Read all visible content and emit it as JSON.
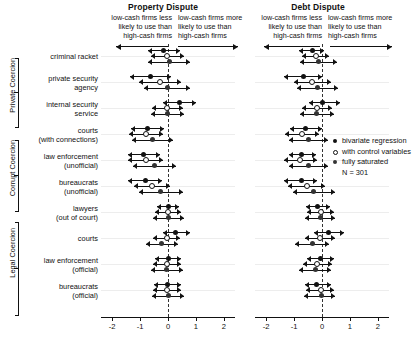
{
  "panels": [
    {
      "title": "Property Dispute",
      "caption_left": "low-cash firms less\nlikely to use than\nhigh-cash firms",
      "caption_right": "low-cash firms more\nlikely to use than\nhigh-cash firms",
      "ticks": [
        "-2",
        "-1",
        "0",
        "1",
        "2"
      ]
    },
    {
      "title": "Debt Dispute",
      "caption_left": "low-cash firms less\nlikely to use than\nhigh-cash firms",
      "caption_right": "low-cash firms more\nlikely to use than\nhigh-cash firms",
      "ticks": [
        "-2",
        "-1",
        "0",
        "1",
        "2"
      ]
    }
  ],
  "groups": [
    {
      "label": "Private Coercion"
    },
    {
      "label": "Corrupt Coercion"
    },
    {
      "label": "Legal Coercion"
    }
  ],
  "categories": [
    "criminal racket",
    "private security\nagency",
    "internal security\nservice",
    "courts\n(with connections)",
    "law enforcement\n(unofficial)",
    "bureaucrats\n(unofficial)",
    "lawyers\n(out of court)",
    "courts",
    "law enforcement\n(official)",
    "bureaucrats\n(official)"
  ],
  "legend": {
    "items": [
      {
        "marker": "filled",
        "label": "bivariate regression"
      },
      {
        "marker": "open",
        "label": "with control variables"
      },
      {
        "marker": "sat",
        "label": "fully saturated"
      }
    ],
    "n_label": "N = 301"
  },
  "chart_data": {
    "type": "scatter",
    "subtype": "coefficient-plot",
    "title": "",
    "xlabel": "",
    "ylabel": "",
    "xlim": [
      -2.4,
      2.4
    ],
    "grid": false,
    "zero_reference_line": 0,
    "legend_position": "middle-right",
    "n": 301,
    "series": [
      {
        "name": "bivariate regression",
        "marker": "filled"
      },
      {
        "name": "with control variables",
        "marker": "open"
      },
      {
        "name": "fully saturated",
        "marker": "sat"
      }
    ],
    "categories": [
      "criminal racket",
      "private security agency",
      "internal security service",
      "courts (with connections)",
      "law enforcement (unofficial)",
      "bureaucrats (unofficial)",
      "lawyers (out of court)",
      "courts",
      "law enforcement (official)",
      "bureaucrats (official)"
    ],
    "groups": [
      {
        "label": "Private Coercion",
        "categories": [
          0,
          1,
          2
        ]
      },
      {
        "label": "Corrupt Coercion",
        "categories": [
          3,
          4,
          5
        ]
      },
      {
        "label": "Legal Coercion",
        "categories": [
          6,
          7,
          8,
          9
        ]
      }
    ],
    "panels": [
      {
        "name": "Property Dispute",
        "estimates": [
          {
            "category": "criminal racket",
            "series": "bivariate regression",
            "estimate": -0.15,
            "ci_low": -0.7,
            "ci_high": 0.42
          },
          {
            "category": "criminal racket",
            "series": "with control variables",
            "estimate": -0.02,
            "ci_low": -0.62,
            "ci_high": 0.58
          },
          {
            "category": "criminal racket",
            "series": "fully saturated",
            "estimate": 0.05,
            "ci_low": -0.7,
            "ci_high": 0.8
          },
          {
            "category": "private security agency",
            "series": "bivariate regression",
            "estimate": -0.62,
            "ci_low": -1.35,
            "ci_high": 0.1
          },
          {
            "category": "private security agency",
            "series": "with control variables",
            "estimate": -0.28,
            "ci_low": -1.05,
            "ci_high": 0.48
          },
          {
            "category": "private security agency",
            "series": "fully saturated",
            "estimate": -0.02,
            "ci_low": -0.85,
            "ci_high": 0.8
          },
          {
            "category": "internal security service",
            "series": "bivariate regression",
            "estimate": 0.4,
            "ci_low": -0.18,
            "ci_high": 1.0
          },
          {
            "category": "internal security service",
            "series": "with control variables",
            "estimate": -0.02,
            "ci_low": -0.58,
            "ci_high": 0.55
          },
          {
            "category": "internal security service",
            "series": "fully saturated",
            "estimate": -0.02,
            "ci_low": -0.62,
            "ci_high": 0.58
          },
          {
            "category": "courts (with connections)",
            "series": "bivariate regression",
            "estimate": -0.72,
            "ci_low": -1.32,
            "ci_high": -0.14
          },
          {
            "category": "courts (with connections)",
            "series": "with control variables",
            "estimate": -0.8,
            "ci_low": -1.4,
            "ci_high": -0.18
          },
          {
            "category": "courts (with connections)",
            "series": "fully saturated",
            "estimate": -0.55,
            "ci_low": -1.28,
            "ci_high": 0.18
          },
          {
            "category": "law enforcement (unofficial)",
            "series": "bivariate regression",
            "estimate": -0.88,
            "ci_low": -1.45,
            "ci_high": -0.28
          },
          {
            "category": "law enforcement (unofficial)",
            "series": "with control variables",
            "estimate": -0.8,
            "ci_low": -1.45,
            "ci_high": -0.18
          },
          {
            "category": "law enforcement (unofficial)",
            "series": "fully saturated",
            "estimate": -0.48,
            "ci_low": -1.25,
            "ci_high": 0.3
          },
          {
            "category": "bureaucrats (unofficial)",
            "series": "bivariate regression",
            "estimate": -0.82,
            "ci_low": -1.42,
            "ci_high": -0.22
          },
          {
            "category": "bureaucrats (unofficial)",
            "series": "with control variables",
            "estimate": -0.58,
            "ci_low": -1.22,
            "ci_high": 0.08
          },
          {
            "category": "bureaucrats (unofficial)",
            "series": "fully saturated",
            "estimate": -0.28,
            "ci_low": -1.05,
            "ci_high": 0.52
          },
          {
            "category": "lawyers (out of court)",
            "series": "bivariate regression",
            "estimate": 0.0,
            "ci_low": -0.4,
            "ci_high": 0.4
          },
          {
            "category": "lawyers (out of court)",
            "series": "with control variables",
            "estimate": 0.0,
            "ci_low": -0.48,
            "ci_high": 0.48
          },
          {
            "category": "lawyers (out of court)",
            "series": "fully saturated",
            "estimate": 0.0,
            "ci_low": -0.55,
            "ci_high": 0.58
          },
          {
            "category": "courts",
            "series": "bivariate regression",
            "estimate": 0.28,
            "ci_low": -0.18,
            "ci_high": 0.78
          },
          {
            "category": "courts",
            "series": "with control variables",
            "estimate": -0.05,
            "ci_low": -0.52,
            "ci_high": 0.42
          },
          {
            "category": "courts",
            "series": "fully saturated",
            "estimate": -0.22,
            "ci_low": -0.78,
            "ci_high": 0.35
          },
          {
            "category": "law enforcement (official)",
            "series": "bivariate regression",
            "estimate": 0.02,
            "ci_low": -0.45,
            "ci_high": 0.48
          },
          {
            "category": "law enforcement (official)",
            "series": "with control variables",
            "estimate": -0.02,
            "ci_low": -0.52,
            "ci_high": 0.48
          },
          {
            "category": "law enforcement (official)",
            "series": "fully saturated",
            "estimate": -0.05,
            "ci_low": -0.62,
            "ci_high": 0.52
          },
          {
            "category": "bureaucrats (official)",
            "series": "bivariate regression",
            "estimate": -0.02,
            "ci_low": -0.5,
            "ci_high": 0.45
          },
          {
            "category": "bureaucrats (official)",
            "series": "with control variables",
            "estimate": -0.05,
            "ci_low": -0.55,
            "ci_high": 0.45
          },
          {
            "category": "bureaucrats (official)",
            "series": "fully saturated",
            "estimate": 0.0,
            "ci_low": -0.58,
            "ci_high": 0.58
          }
        ]
      },
      {
        "name": "Debt Dispute",
        "estimates": [
          {
            "category": "criminal racket",
            "series": "bivariate regression",
            "estimate": -0.35,
            "ci_low": -0.82,
            "ci_high": 0.08
          },
          {
            "category": "criminal racket",
            "series": "with control variables",
            "estimate": -0.22,
            "ci_low": -0.72,
            "ci_high": 0.25
          },
          {
            "category": "criminal racket",
            "series": "fully saturated",
            "estimate": -0.12,
            "ci_low": -0.78,
            "ci_high": 0.52
          },
          {
            "category": "private security agency",
            "series": "bivariate regression",
            "estimate": -0.68,
            "ci_low": -1.35,
            "ci_high": 0.0
          },
          {
            "category": "private security agency",
            "series": "with control variables",
            "estimate": -0.35,
            "ci_low": -1.02,
            "ci_high": 0.32
          },
          {
            "category": "private security agency",
            "series": "fully saturated",
            "estimate": -0.15,
            "ci_low": -0.88,
            "ci_high": 0.58
          },
          {
            "category": "internal security service",
            "series": "bivariate regression",
            "estimate": 0.02,
            "ci_low": -0.48,
            "ci_high": 0.65
          },
          {
            "category": "internal security service",
            "series": "with control variables",
            "estimate": -0.18,
            "ci_low": -0.72,
            "ci_high": 0.35
          },
          {
            "category": "internal security service",
            "series": "fully saturated",
            "estimate": -0.18,
            "ci_low": -0.78,
            "ci_high": 0.42
          },
          {
            "category": "courts (with connections)",
            "series": "bivariate regression",
            "estimate": -0.58,
            "ci_low": -1.15,
            "ci_high": 0.0
          },
          {
            "category": "courts (with connections)",
            "series": "with control variables",
            "estimate": -0.72,
            "ci_low": -1.32,
            "ci_high": -0.12
          },
          {
            "category": "courts (with connections)",
            "series": "fully saturated",
            "estimate": -0.48,
            "ci_low": -1.18,
            "ci_high": 0.22
          },
          {
            "category": "law enforcement (unofficial)",
            "series": "bivariate regression",
            "estimate": -0.72,
            "ci_low": -1.18,
            "ci_high": -0.22
          },
          {
            "category": "law enforcement (unofficial)",
            "series": "with control variables",
            "estimate": -0.78,
            "ci_low": -1.35,
            "ci_high": -0.18
          },
          {
            "category": "law enforcement (unofficial)",
            "series": "fully saturated",
            "estimate": -0.48,
            "ci_low": -1.18,
            "ci_high": 0.22
          },
          {
            "category": "bureaucrats (unofficial)",
            "series": "bivariate regression",
            "estimate": -0.75,
            "ci_low": -1.35,
            "ci_high": -0.18
          },
          {
            "category": "bureaucrats (unofficial)",
            "series": "with control variables",
            "estimate": -0.55,
            "ci_low": -1.22,
            "ci_high": 0.1
          },
          {
            "category": "bureaucrats (unofficial)",
            "series": "fully saturated",
            "estimate": -0.32,
            "ci_low": -1.05,
            "ci_high": 0.45
          },
          {
            "category": "lawyers (out of court)",
            "series": "bivariate regression",
            "estimate": -0.15,
            "ci_low": -0.58,
            "ci_high": 0.28
          },
          {
            "category": "lawyers (out of court)",
            "series": "with control variables",
            "estimate": -0.05,
            "ci_low": -0.55,
            "ci_high": 0.42
          },
          {
            "category": "lawyers (out of court)",
            "series": "fully saturated",
            "estimate": -0.05,
            "ci_low": -0.62,
            "ci_high": 0.48
          },
          {
            "category": "courts",
            "series": "bivariate regression",
            "estimate": 0.25,
            "ci_low": -0.28,
            "ci_high": 0.78
          },
          {
            "category": "courts",
            "series": "with control variables",
            "estimate": -0.08,
            "ci_low": -0.62,
            "ci_high": 0.45
          },
          {
            "category": "courts",
            "series": "fully saturated",
            "estimate": -0.35,
            "ci_low": -0.95,
            "ci_high": 0.25
          },
          {
            "category": "law enforcement (official)",
            "series": "bivariate regression",
            "estimate": -0.05,
            "ci_low": -0.52,
            "ci_high": 0.42
          },
          {
            "category": "law enforcement (official)",
            "series": "with control variables",
            "estimate": -0.18,
            "ci_low": -0.68,
            "ci_high": 0.35
          },
          {
            "category": "law enforcement (official)",
            "series": "fully saturated",
            "estimate": -0.25,
            "ci_low": -0.82,
            "ci_high": 0.32
          },
          {
            "category": "bureaucrats (official)",
            "series": "bivariate regression",
            "estimate": -0.18,
            "ci_low": -0.62,
            "ci_high": 0.32
          },
          {
            "category": "bureaucrats (official)",
            "series": "with control variables",
            "estimate": -0.05,
            "ci_low": -0.58,
            "ci_high": 0.42
          },
          {
            "category": "bureaucrats (official)",
            "series": "fully saturated",
            "estimate": -0.02,
            "ci_low": -0.65,
            "ci_high": 0.48
          }
        ]
      }
    ]
  }
}
